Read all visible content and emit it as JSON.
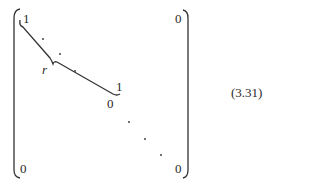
{
  "equation": {
    "number": "(3.31)",
    "matrix": {
      "top_left": "1",
      "top_right": "0",
      "block_end": "1",
      "block_next": "0",
      "bottom_left": "0",
      "bottom_right": "0",
      "brace_label": "r"
    }
  }
}
